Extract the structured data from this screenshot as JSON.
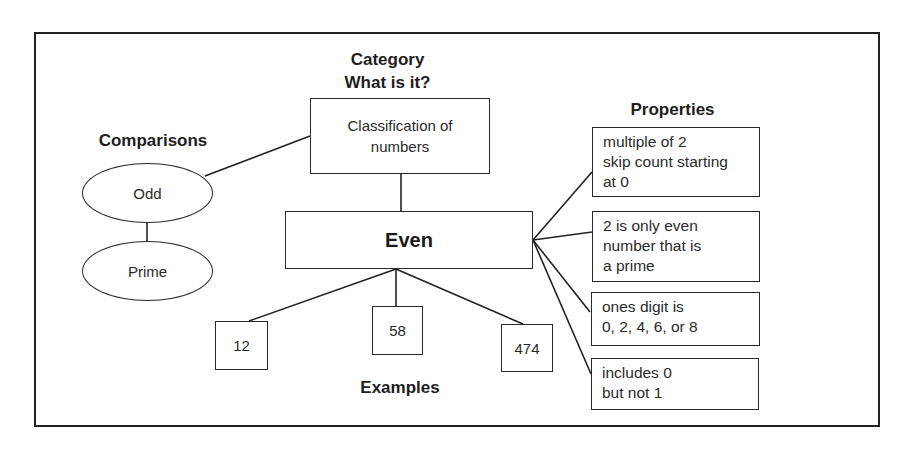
{
  "diagram": {
    "type": "concept-map (Frayer-style)",
    "center": {
      "label": "Even"
    },
    "category": {
      "heading_line1": "Category",
      "heading_line2": "What is it?",
      "box_line1": "Classification of",
      "box_line2": "numbers"
    },
    "comparisons": {
      "heading": "Comparisons",
      "items": [
        "Odd",
        "Prime"
      ]
    },
    "properties": {
      "heading": "Properties",
      "items": [
        {
          "lines": [
            "multiple of 2",
            "skip count starting",
            "at 0"
          ]
        },
        {
          "lines": [
            "2 is only even",
            "number that is",
            "a prime"
          ]
        },
        {
          "lines": [
            "ones digit is",
            "0, 2, 4, 6, or 8"
          ]
        },
        {
          "lines": [
            "includes 0",
            "but not 1"
          ]
        }
      ]
    },
    "examples": {
      "heading": "Examples",
      "items": [
        "12",
        "58",
        "474"
      ]
    },
    "colors": {
      "line": "#222222",
      "background": "#ffffff",
      "text": "#1e1e1e"
    }
  }
}
